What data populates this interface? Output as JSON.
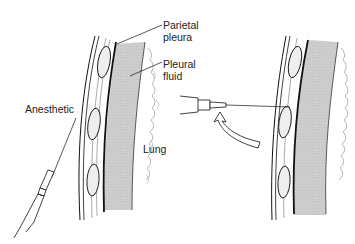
{
  "diagram": {
    "left_panel": {
      "labels": {
        "parietal_pleura": [
          "Parietal",
          "pleura"
        ],
        "pleural_fluid": [
          "Pleural",
          "fluid"
        ],
        "anesthetic": "Anesthetic",
        "lung": "Lung"
      }
    },
    "right_panel": {
      "arrow": "curved-arrow-upward-left"
    },
    "colors": {
      "line": "#111111",
      "fluid": "#cfcfcf",
      "background": "#ffffff"
    }
  }
}
